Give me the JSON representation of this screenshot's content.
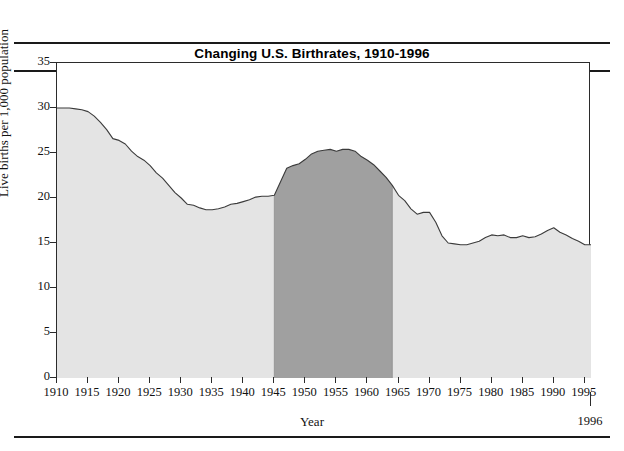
{
  "title": "Changing U.S. Birthrates, 1910-1996",
  "axes": {
    "xlabel": "Year",
    "ylabel": "Live births per 1,000 population",
    "end_label": "1996"
  },
  "colors": {
    "area_light": "#e4e4e4",
    "area_dark": "#a0a0a0",
    "line": "#3b3b3b",
    "frame": "#2b2b2b",
    "rule": "#1a1a1a"
  },
  "chart_data": {
    "type": "area",
    "title": "Changing U.S. Birthrates, 1910-1996",
    "xlabel": "Year",
    "ylabel": "Live births per 1,000 population",
    "xlim": [
      1910,
      1996
    ],
    "ylim": [
      0,
      35
    ],
    "yticks": [
      0,
      5,
      10,
      15,
      20,
      25,
      30,
      35
    ],
    "xticks": [
      1910,
      1915,
      1920,
      1925,
      1930,
      1935,
      1940,
      1945,
      1950,
      1955,
      1960,
      1965,
      1970,
      1975,
      1980,
      1985,
      1990,
      1995
    ],
    "grid": false,
    "legend": null,
    "highlight_region": {
      "label": "Baby Boom",
      "x_start": 1945,
      "x_end": 1964,
      "color": "#a0a0a0"
    },
    "series": [
      {
        "name": "Live births per 1,000 population",
        "x": [
          1910,
          1911,
          1912,
          1913,
          1914,
          1915,
          1916,
          1917,
          1918,
          1919,
          1920,
          1921,
          1922,
          1923,
          1924,
          1925,
          1926,
          1927,
          1928,
          1929,
          1930,
          1931,
          1932,
          1933,
          1934,
          1935,
          1936,
          1937,
          1938,
          1939,
          1940,
          1941,
          1942,
          1943,
          1944,
          1945,
          1946,
          1947,
          1948,
          1949,
          1950,
          1951,
          1952,
          1953,
          1954,
          1955,
          1956,
          1957,
          1958,
          1959,
          1960,
          1961,
          1962,
          1963,
          1964,
          1965,
          1966,
          1967,
          1968,
          1969,
          1970,
          1971,
          1972,
          1973,
          1974,
          1975,
          1976,
          1977,
          1978,
          1979,
          1980,
          1981,
          1982,
          1983,
          1984,
          1985,
          1986,
          1987,
          1988,
          1989,
          1990,
          1991,
          1992,
          1993,
          1994,
          1995,
          1996
        ],
        "y": [
          30.0,
          30.0,
          30.0,
          29.9,
          29.8,
          29.6,
          29.1,
          28.4,
          27.6,
          26.6,
          26.4,
          26.0,
          25.2,
          24.6,
          24.2,
          23.6,
          22.8,
          22.2,
          21.4,
          20.6,
          20.0,
          19.3,
          19.2,
          18.9,
          18.7,
          18.7,
          18.8,
          19.0,
          19.3,
          19.4,
          19.6,
          19.8,
          20.1,
          20.2,
          20.2,
          20.3,
          21.8,
          23.3,
          23.6,
          23.8,
          24.3,
          24.9,
          25.2,
          25.3,
          25.4,
          25.2,
          25.4,
          25.4,
          25.2,
          24.6,
          24.2,
          23.7,
          23.0,
          22.3,
          21.4,
          20.3,
          19.7,
          18.8,
          18.2,
          18.4,
          18.4,
          17.3,
          15.8,
          15.0,
          14.9,
          14.8,
          14.8,
          15.0,
          15.2,
          15.6,
          15.9,
          15.8,
          15.9,
          15.6,
          15.6,
          15.8,
          15.6,
          15.7,
          16.0,
          16.4,
          16.7,
          16.2,
          15.9,
          15.5,
          15.2,
          14.8,
          14.8
        ]
      }
    ]
  }
}
